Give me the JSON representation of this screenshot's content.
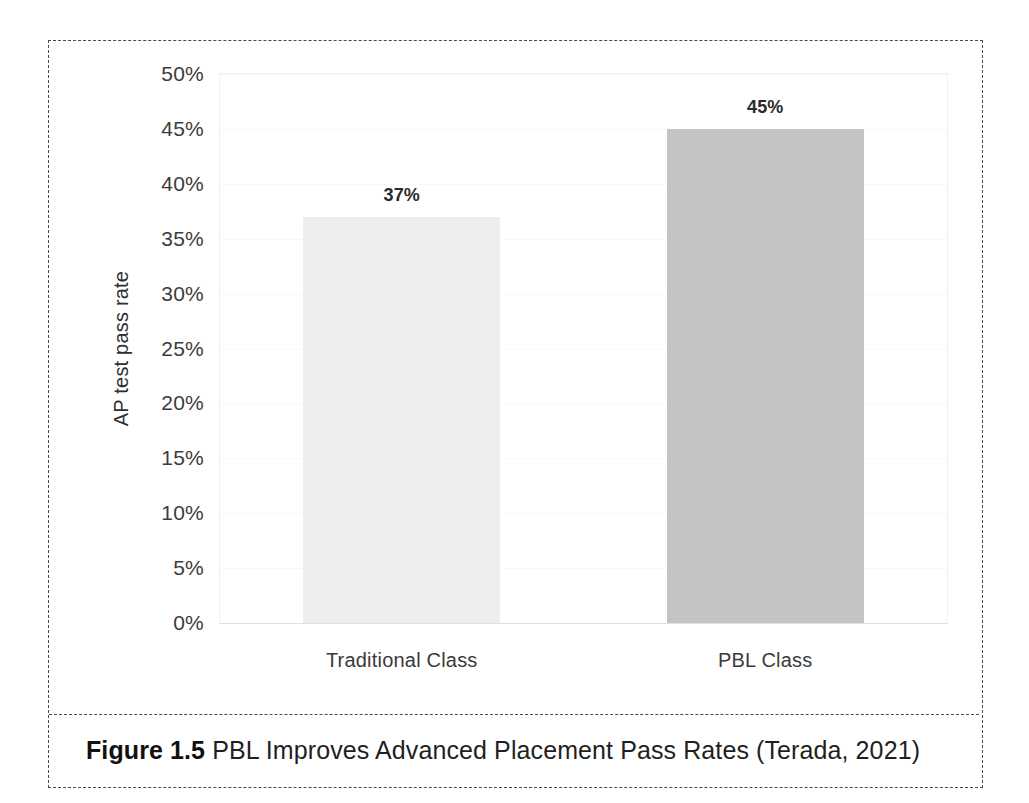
{
  "figure": {
    "caption_label": "Figure 1.5",
    "caption_text": " PBL Improves Advanced Placement Pass Rates (Terada, 2021)"
  },
  "chart_data": {
    "type": "bar",
    "title": "",
    "xlabel": "",
    "ylabel": "AP test pass rate",
    "categories": [
      "Traditional Class",
      "PBL Class"
    ],
    "values": [
      37,
      45
    ],
    "value_labels": [
      "37%",
      "45%"
    ],
    "ylim": [
      0,
      50
    ],
    "ytick_values": [
      50,
      45,
      40,
      35,
      30,
      25,
      20,
      15,
      10,
      5,
      0
    ],
    "ytick_labels": [
      "50%",
      "45%",
      "40%",
      "35%",
      "30%",
      "25%",
      "20%",
      "15%",
      "10%",
      "5%",
      "0%"
    ],
    "grid": true,
    "legend": "none",
    "series": [
      {
        "name": "AP test pass rate",
        "values": [
          37,
          45
        ],
        "colors": [
          "#ededed",
          "#c4c4c4"
        ]
      }
    ],
    "colors": {
      "bar_traditional": "#ededed",
      "bar_pbl": "#c4c4c4",
      "frame_dash": "#4a4a4a",
      "text": "#2e2e2e",
      "gridline": "#f0f0f0"
    }
  }
}
